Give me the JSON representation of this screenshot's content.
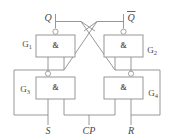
{
  "figure": {
    "kind": "logic-circuit-diagram",
    "background_color": "#ffffff",
    "line_color": "#8c8c8c",
    "text_color": "#4a4a4a"
  },
  "gates": [
    {
      "id": "G1",
      "name": "G",
      "subscript": "1",
      "symbol": "&",
      "type": "NAND",
      "label_position": "left",
      "box": {
        "x": 36,
        "y": 35,
        "w": 39,
        "h": 22
      }
    },
    {
      "id": "G2",
      "name": "G",
      "subscript": "2",
      "symbol": "&",
      "type": "NAND",
      "label_position": "right",
      "box": {
        "x": 104,
        "y": 35,
        "w": 39,
        "h": 22
      }
    },
    {
      "id": "G3",
      "name": "G",
      "subscript": "3",
      "symbol": "&",
      "type": "NAND",
      "label_position": "left",
      "box": {
        "x": 36,
        "y": 77,
        "w": 39,
        "h": 22
      }
    },
    {
      "id": "G4",
      "name": "G",
      "subscript": "4",
      "symbol": "&",
      "type": "NAND",
      "label_position": "right",
      "box": {
        "x": 104,
        "y": 77,
        "w": 39,
        "h": 22
      }
    }
  ],
  "terminals": [
    {
      "id": "Q",
      "label": "Q",
      "overbar": false,
      "position": "top-left",
      "x": 55,
      "y": 17
    },
    {
      "id": "Qbar",
      "label": "Q",
      "overbar": true,
      "position": "top-right",
      "x": 128,
      "y": 17
    },
    {
      "id": "S",
      "label": "S",
      "overbar": false,
      "position": "bottom-left",
      "x": 48,
      "y": 131
    },
    {
      "id": "CP",
      "label": "CP",
      "overbar": false,
      "position": "bottom-mid",
      "x": 89,
      "y": 131
    },
    {
      "id": "R",
      "label": "R",
      "overbar": false,
      "position": "bottom-right",
      "x": 132,
      "y": 131
    }
  ],
  "gate_labels": {
    "G1": "G",
    "G2": "G",
    "G3": "G",
    "G4": "G",
    "sub1": "1",
    "sub2": "2",
    "sub3": "3",
    "sub4": "4"
  },
  "symbols": {
    "and_symbol": "&"
  }
}
